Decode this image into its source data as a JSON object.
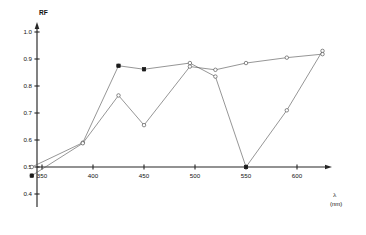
{
  "chart_data": {
    "type": "line",
    "title": "",
    "subtitle": "",
    "xlabel": "λ (nm)",
    "ylabel": "RF",
    "xlim": [
      335,
      640
    ],
    "ylim": [
      0.4,
      1.02
    ],
    "xticks": [
      350,
      400,
      450,
      500,
      550,
      600
    ],
    "xtick_labels": [
      "350",
      "400",
      "450",
      "500",
      "550",
      "600"
    ],
    "yticks": [
      0.4,
      0.5,
      0.6,
      0.7,
      0.8,
      0.9,
      1.0
    ],
    "ytick_labels": [
      "0.4",
      "0.5",
      "0.6",
      "0.7",
      "0.8",
      "0.9",
      "1.0"
    ],
    "grid": false,
    "legend": "none",
    "marker": "open-circle",
    "series": [
      {
        "name": "series-1",
        "marker": "open-circle",
        "x": [
          340,
          390,
          425,
          450,
          495,
          520,
          550,
          590,
          625
        ],
        "y": [
          0.5,
          0.59,
          0.875,
          0.862,
          0.885,
          0.835,
          0.5,
          0.71,
          0.93
        ]
      },
      {
        "name": "series-2",
        "marker": "open-circle",
        "x": [
          340,
          390,
          425,
          450,
          495,
          520,
          550,
          590,
          625
        ],
        "y": [
          0.468,
          0.588,
          0.765,
          0.655,
          0.872,
          0.86,
          0.885,
          0.905,
          0.918
        ]
      }
    ],
    "annotations": []
  },
  "axis": {
    "y_title": "RF",
    "x_symbol": "λ",
    "x_unit": "(nm)"
  }
}
